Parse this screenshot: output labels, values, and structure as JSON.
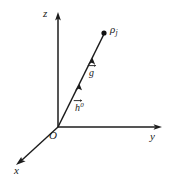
{
  "figure": {
    "kind": "3d-coordinate-axes-vector-diagram",
    "background_color": "#ffffff",
    "ink_color": "#1c1c1c",
    "axes": {
      "z_label": "z",
      "y_label": "y",
      "x_label": "x",
      "origin_label": "O"
    },
    "point": {
      "symbol": "ρ",
      "subscript": "j"
    },
    "vectors": [
      {
        "name": "g-vector",
        "symbol": "g",
        "superscript": "",
        "has_overarrow": true
      },
      {
        "name": "h-vector",
        "symbol": "h",
        "superscript": "0",
        "has_overarrow": true
      }
    ],
    "geometry": {
      "origin": [
        58,
        127
      ],
      "z_tip": [
        58,
        14
      ],
      "y_tip": [
        161,
        127
      ],
      "x_tip": [
        16,
        164
      ],
      "ray_tip": [
        104,
        33
      ]
    }
  }
}
